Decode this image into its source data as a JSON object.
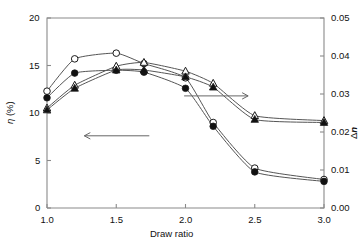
{
  "chart_data": {
    "type": "line",
    "title": "",
    "xlabel": "Draw ratio",
    "ylabel_left": "η (%)",
    "ylabel_right": "Δn",
    "xlim": [
      1.0,
      3.0
    ],
    "ylim_left": [
      0,
      20
    ],
    "ylim_right": [
      0.0,
      0.05
    ],
    "xticks": [
      "1.0",
      "1.5",
      "2.0",
      "2.5",
      "3.0"
    ],
    "xtick_values": [
      1.0,
      1.5,
      2.0,
      2.5,
      3.0
    ],
    "yticks_left": [
      "0",
      "5",
      "10",
      "15",
      "20"
    ],
    "ytick_values_left": [
      0,
      5,
      10,
      15,
      20
    ],
    "yticks_right": [
      "0.00",
      "0.01",
      "0.02",
      "0.03",
      "0.04",
      "0.05"
    ],
    "ytick_values_right": [
      0.0,
      0.01,
      0.02,
      0.03,
      0.04,
      0.05
    ],
    "grid": false,
    "legend": "none",
    "annotations": [
      {
        "name": "left-arrow",
        "text": "←",
        "meaning": "circle series read on left axis",
        "x": 1.45,
        "y_left": 7.6
      },
      {
        "name": "right-arrow",
        "text": "→",
        "meaning": "triangle series read on right axis",
        "x": 2.25,
        "y_right": 0.0295
      }
    ],
    "series": [
      {
        "name": "eta-open-circle",
        "marker": "open-circle",
        "axis": "left",
        "x": [
          1.0,
          1.2,
          1.5,
          1.7,
          2.0,
          2.2,
          2.5,
          3.0
        ],
        "values": [
          12.3,
          15.7,
          16.3,
          15.2,
          13.7,
          9.0,
          4.2,
          3.0
        ]
      },
      {
        "name": "eta-filled-circle",
        "marker": "filled-circle",
        "axis": "left",
        "x": [
          1.0,
          1.2,
          1.5,
          1.7,
          2.0,
          2.2,
          2.5,
          3.0
        ],
        "values": [
          11.6,
          14.2,
          14.5,
          14.3,
          12.6,
          8.6,
          3.8,
          2.8
        ]
      },
      {
        "name": "dn-open-triangle",
        "marker": "open-triangle",
        "axis": "right",
        "x": [
          1.0,
          1.2,
          1.5,
          1.7,
          2.0,
          2.2,
          2.5,
          3.0
        ],
        "values": [
          0.0263,
          0.0323,
          0.0373,
          0.0383,
          0.036,
          0.0328,
          0.0243,
          0.023
        ]
      },
      {
        "name": "dn-filled-triangle",
        "marker": "filled-triangle",
        "axis": "right",
        "x": [
          1.0,
          1.2,
          1.5,
          1.7,
          2.0,
          2.2,
          2.5,
          3.0
        ],
        "values": [
          0.0258,
          0.0315,
          0.0363,
          0.0363,
          0.0345,
          0.0318,
          0.0233,
          0.0225
        ]
      }
    ]
  },
  "style": {
    "line_color": "#555555",
    "marker_stroke": "#1a1a1a",
    "marker_fill_open": "#ffffff",
    "marker_fill_closed": "#111111",
    "axis_color": "#8a8a8a",
    "background": "#ffffff"
  }
}
